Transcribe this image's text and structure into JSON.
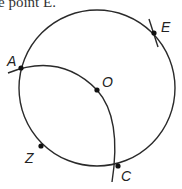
{
  "caption": "e point E.",
  "diagram": {
    "circle": {
      "cx": 97,
      "cy": 88,
      "r": 78
    },
    "points": [
      {
        "label": "E",
        "x": 154,
        "y": 33,
        "lx": 161,
        "ly": 32
      },
      {
        "label": "A",
        "x": 21,
        "y": 68,
        "lx": 8,
        "ly": 66
      },
      {
        "label": "O",
        "x": 97,
        "y": 90,
        "lx": 101,
        "ly": 86
      },
      {
        "label": "Z",
        "x": 41,
        "y": 146,
        "lx": 26,
        "ly": 162
      },
      {
        "label": "C",
        "x": 118,
        "y": 166,
        "lx": 121,
        "ly": 181
      }
    ],
    "labels": {
      "E": "E",
      "A": "A",
      "O": "O",
      "Z": "Z",
      "C": "C"
    },
    "stroke_color": "#2a2a2a"
  }
}
